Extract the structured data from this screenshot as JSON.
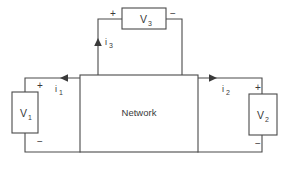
{
  "diagram": {
    "type": "circuit-schematic",
    "canvas": {
      "width": 288,
      "height": 169
    },
    "colors": {
      "background": "#ffffff",
      "line": "#4a4a4a",
      "arrow": "#3a3a3a",
      "text": "#3a3a3a"
    },
    "network_block": {
      "label": "Network"
    },
    "sources": [
      {
        "id": "v1",
        "label": "V",
        "subscript": "1",
        "plus": "+",
        "minus": "−",
        "position": "left",
        "plus_at": "top",
        "minus_at": "bottom"
      },
      {
        "id": "v2",
        "label": "V",
        "subscript": "2",
        "plus": "+",
        "minus": "−",
        "position": "right",
        "plus_at": "top",
        "minus_at": "bottom"
      },
      {
        "id": "v3",
        "label": "V",
        "subscript": "3",
        "plus": "+",
        "minus": "−",
        "position": "top",
        "plus_at": "left",
        "minus_at": "right"
      }
    ],
    "currents": [
      {
        "id": "i1",
        "label": "i",
        "subscript": "1",
        "direction": "left",
        "branch": "top-left"
      },
      {
        "id": "i2",
        "label": "i",
        "subscript": "2",
        "direction": "right",
        "branch": "top-right"
      },
      {
        "id": "i3",
        "label": "i",
        "subscript": "3",
        "direction": "up",
        "branch": "top-center"
      }
    ]
  }
}
